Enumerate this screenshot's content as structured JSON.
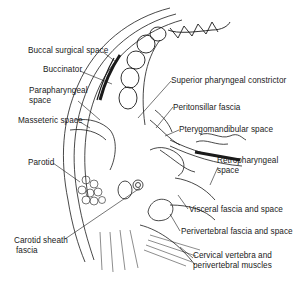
{
  "figure": {
    "labels_left": [
      {
        "id": "buccal-surgical-space",
        "text": "Buccal surgical space"
      },
      {
        "id": "buccinator",
        "text": "Buccinator"
      },
      {
        "id": "parapharyngeal-space",
        "line1": "Parapharyngeal",
        "line2": "space"
      },
      {
        "id": "masseteric-space",
        "text": "Masseteric space"
      },
      {
        "id": "parotid",
        "text": "Parotid"
      },
      {
        "id": "carotid-sheath-fascia",
        "line1": "Carotid sheath",
        "line2": "fascia"
      }
    ],
    "labels_right": [
      {
        "id": "superior-pharyngeal-constrictor",
        "text": "Superior pharyngeal constrictor"
      },
      {
        "id": "peritonsillar-fascia",
        "text": "Peritonsillar fascia"
      },
      {
        "id": "pterygomandibular-space",
        "text": "Pterygomandibular space"
      },
      {
        "id": "retropharyngeal-space",
        "line1": "Retropharyngeal",
        "line2": "space"
      },
      {
        "id": "visceral-fascia-and-space",
        "text": "Visceral fascia and space"
      },
      {
        "id": "perivertebral-fascia-and-space",
        "text": "Perivertebral fascia and space"
      },
      {
        "id": "cervical-vertebra",
        "line1": "Cervical vertebra and",
        "line2": "perivertebral muscles"
      }
    ],
    "colors": {
      "ink": "#1a1a1a",
      "background": "#ffffff"
    }
  }
}
